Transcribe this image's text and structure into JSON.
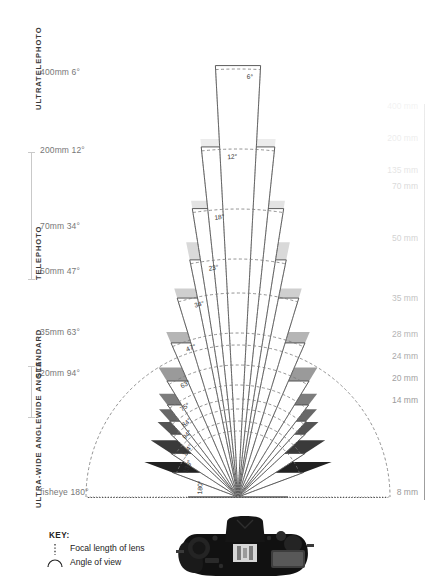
{
  "categories": [
    {
      "name": "ULTRATELEPHOTO",
      "label": "ULTRATELEPHOTO",
      "top": 18,
      "height": 92,
      "bracket": false
    },
    {
      "name": "TELEPHOTO",
      "label": "TELEPHOTO",
      "top": 152,
      "height": 128,
      "bracket": true
    },
    {
      "name": "STANDARD",
      "label": "STANDARD",
      "top": 312,
      "height": 66,
      "bracket": false
    },
    {
      "name": "WIDE ANGLE",
      "label": "WIDE ANGLE",
      "top": 366,
      "height": 52,
      "bracket": true
    },
    {
      "name": "ULTRA-WIDE ANGLE",
      "label": "ULTRA-WIDE ANGLE",
      "top": 424,
      "height": 84,
      "bracket": false
    }
  ],
  "left_labels": [
    {
      "text": "400mm 6°",
      "y": 72
    },
    {
      "text": "200mm 12°",
      "y": 150
    },
    {
      "text": "70mm 34°",
      "y": 226
    },
    {
      "text": "50mm 47°",
      "y": 271
    },
    {
      "text": "35mm 63°",
      "y": 332
    },
    {
      "text": "20mm 94°",
      "y": 373
    },
    {
      "text": "fisheye 180°",
      "y": 492
    }
  ],
  "right_labels": [
    {
      "text": "400 mm",
      "y": 106,
      "opacity": 0.12
    },
    {
      "text": "200 mm",
      "y": 138,
      "opacity": 0.18
    },
    {
      "text": "135 mm",
      "y": 170,
      "opacity": 0.26
    },
    {
      "text": "70 mm",
      "y": 186,
      "opacity": 0.36
    },
    {
      "text": "50 mm",
      "y": 238,
      "opacity": 0.44
    },
    {
      "text": "35 mm",
      "y": 298,
      "opacity": 0.62
    },
    {
      "text": "28 mm",
      "y": 334,
      "opacity": 0.74
    },
    {
      "text": "24 mm",
      "y": 356,
      "opacity": 0.84
    },
    {
      "text": "20 mm",
      "y": 378,
      "opacity": 0.92
    },
    {
      "text": "14 mm",
      "y": 400,
      "opacity": 1.0
    },
    {
      "text": "8 mm",
      "y": 492,
      "opacity": 1.0
    }
  ],
  "key": {
    "title": "KEY:",
    "rows": [
      {
        "icon": "dotted-line-icon",
        "label": "Focal length of lens"
      },
      {
        "icon": "arc-icon",
        "label": "Angle of view"
      }
    ]
  },
  "chart_data": {
    "type": "pie",
    "subtitle": "Nested wedges radiating from a common apex (camera sensor position)",
    "apex": {
      "x": 238,
      "y": 497
    },
    "xlabel": "",
    "ylabel": "",
    "legend_position": "bottom-left",
    "grid": false,
    "wedges": [
      {
        "focal_mm": 400,
        "angle_deg": 6,
        "label": "6°",
        "radius": 432,
        "fill": "#ffffff",
        "stroke": "#4a4a4a",
        "dash_radius": 428
      },
      {
        "focal_mm": 200,
        "angle_deg": 12,
        "label": "12°",
        "radius": 352,
        "fill": "#ffffff",
        "stroke": "#4a4a4a",
        "dash_radius": 348
      },
      {
        "focal_mm": 135,
        "angle_deg": 18,
        "label": "18°",
        "radius": 292,
        "fill": "#ffffff",
        "stroke": "#4a4a4a",
        "dash_radius": 288
      },
      {
        "focal_mm": 105,
        "angle_deg": 23,
        "label": "23°",
        "radius": 242,
        "fill": "#ffffff",
        "stroke": "#4a4a4a",
        "dash_radius": 238
      },
      {
        "focal_mm": 70,
        "angle_deg": 34,
        "label": "34°",
        "radius": 208,
        "fill": "#ffffff",
        "stroke": "#4a4a4a",
        "dash_radius": 204
      },
      {
        "focal_mm": 50,
        "angle_deg": 47,
        "label": "47°",
        "radius": 168,
        "fill": "#ffffff",
        "stroke": "#4a4a4a",
        "dash_radius": 164
      },
      {
        "focal_mm": 35,
        "angle_deg": 63,
        "label": "63°",
        "radius": 136,
        "fill": "#ffffff",
        "stroke": "#4a4a4a",
        "dash_radius": 132
      },
      {
        "focal_mm": 28,
        "angle_deg": 75,
        "label": "75°",
        "radius": 116,
        "fill": "#ffffff",
        "stroke": "#4a4a4a",
        "dash_radius": 112
      },
      {
        "focal_mm": 24,
        "angle_deg": 84,
        "label": "84°",
        "radius": 102,
        "fill": "#ffffff",
        "stroke": "#4a4a4a",
        "dash_radius": 98
      },
      {
        "focal_mm": 20,
        "angle_deg": 94,
        "label": "94°",
        "radius": 92,
        "fill": "#ffffff",
        "stroke": "#4a4a4a",
        "dash_radius": 88
      },
      {
        "focal_mm": 14,
        "angle_deg": 114,
        "label": "114°",
        "radius": 80,
        "fill": "#ffffff",
        "stroke": "#4a4a4a",
        "dash_radius": 76
      },
      {
        "focal_mm": 12,
        "angle_deg": 139,
        "label": "139°",
        "radius": 70,
        "fill": "#ffffff",
        "stroke": "#4a4a4a",
        "dash_radius": 66
      },
      {
        "focal_mm": 8,
        "angle_deg": 180,
        "label": "180°",
        "radius": 50,
        "fill": "#ffffff",
        "stroke": "#4a4a4a",
        "dash_radius": 152
      }
    ],
    "gray_bands": [
      {
        "angle_deg": 6,
        "radius": 430,
        "fill": "#f2f2f2"
      },
      {
        "angle_deg": 12,
        "radius": 360,
        "fill": "#ececec"
      },
      {
        "angle_deg": 18,
        "radius": 300,
        "fill": "#e3e3e3"
      },
      {
        "angle_deg": 23,
        "radius": 260,
        "fill": "#d9d9d9"
      },
      {
        "angle_deg": 34,
        "radius": 218,
        "fill": "#cfcfcf"
      },
      {
        "angle_deg": 47,
        "radius": 180,
        "fill": "#b5b5b5"
      },
      {
        "angle_deg": 63,
        "radius": 152,
        "fill": "#9a9a9a"
      },
      {
        "angle_deg": 75,
        "radius": 130,
        "fill": "#7d7d7d"
      },
      {
        "angle_deg": 84,
        "radius": 118,
        "fill": "#686868"
      },
      {
        "angle_deg": 94,
        "radius": 110,
        "fill": "#545454"
      },
      {
        "angle_deg": 114,
        "radius": 104,
        "fill": "#3a3a3a"
      },
      {
        "angle_deg": 139,
        "radius": 100,
        "fill": "#222222"
      },
      {
        "angle_deg": 180,
        "radius": 96,
        "fill": "#000000"
      }
    ],
    "ylim": [
      0,
      180
    ],
    "units": "degrees"
  },
  "colors": {
    "background": "#ffffff",
    "text": "#4d4d4d",
    "muted": "#9a9a9a",
    "stroke": "#4a4a4a",
    "fisheye_fill": "#000000"
  }
}
